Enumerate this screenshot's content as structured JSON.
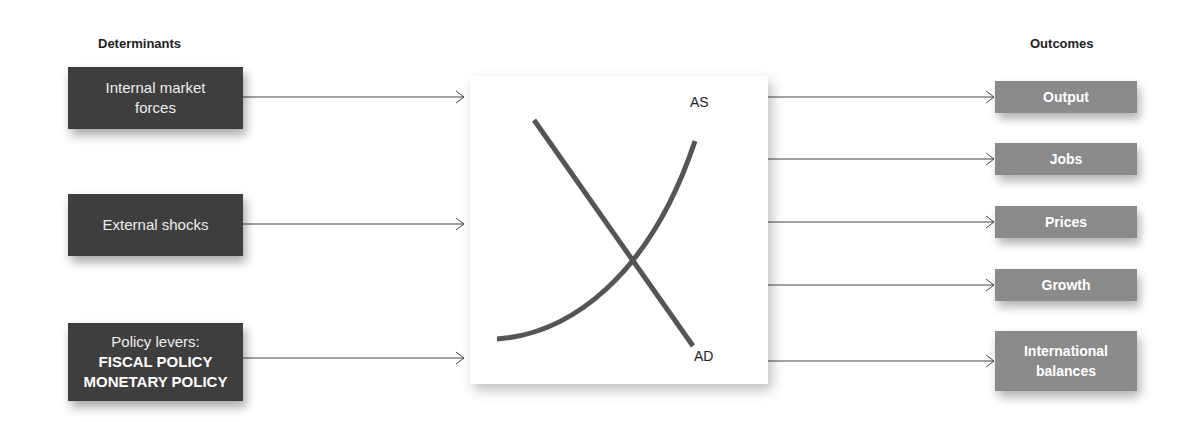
{
  "headers": {
    "left": "Determinants",
    "right": "Outcomes"
  },
  "determinants": [
    {
      "lines": [
        "Internal market",
        "forces"
      ]
    },
    {
      "lines": [
        "External shocks"
      ]
    },
    {
      "lines": [
        "Policy levers:"
      ],
      "bold_lines": [
        "FISCAL POLICY",
        "MONETARY POLICY"
      ]
    }
  ],
  "center": {
    "curve_labels": {
      "as": "AS",
      "ad": "AD"
    }
  },
  "outcomes": [
    {
      "lines": [
        "Output"
      ]
    },
    {
      "lines": [
        "Jobs"
      ]
    },
    {
      "lines": [
        "Prices"
      ]
    },
    {
      "lines": [
        "Growth"
      ]
    },
    {
      "lines": [
        "International",
        "balances"
      ]
    }
  ],
  "colors": {
    "determinant_box": "#3e3e3e",
    "outcome_box": "#8a8a8a",
    "curve": "#555555",
    "arrow": "#444444"
  }
}
